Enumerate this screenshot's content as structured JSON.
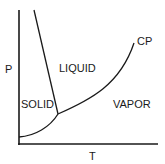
{
  "diagram": {
    "type": "phase-diagram",
    "axes": {
      "x_label": "T",
      "y_label": "P"
    },
    "regions": {
      "solid": "SOLID",
      "liquid": "LIQUID",
      "vapor": "VAPOR"
    },
    "points": {
      "critical_point": "CP"
    },
    "curves": [
      "melting",
      "vaporization",
      "sublimation"
    ],
    "colors": {
      "line": "#1a1a1a",
      "background": "#ffffff"
    }
  }
}
